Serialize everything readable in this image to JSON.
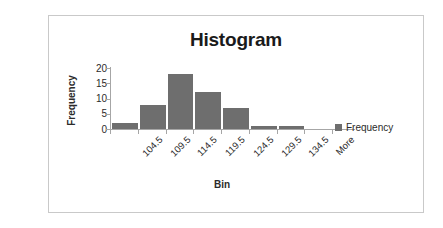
{
  "card": {
    "background": "#ffffff",
    "border_color": "#c9c9c9"
  },
  "chart_data": {
    "type": "bar",
    "title": "Histogram",
    "xlabel": "Bin",
    "ylabel": "Frequency",
    "categories": [
      "104.5",
      "109.5",
      "114.5",
      "119.5",
      "124.5",
      "129.5",
      "134.5",
      "More"
    ],
    "values": [
      2,
      8,
      18,
      12,
      7,
      1,
      1,
      0
    ],
    "series": [
      {
        "name": "Frequency",
        "values": [
          2,
          8,
          18,
          12,
          7,
          1,
          1,
          0
        ],
        "color": "#6e6e6e"
      }
    ],
    "ylim": [
      0,
      20
    ],
    "ytick_values": [
      0,
      5,
      10,
      15,
      20
    ],
    "ytick_labels": [
      "0",
      "5",
      "10",
      "15",
      "20"
    ],
    "grid": false,
    "legend": {
      "position": "right",
      "entries": [
        "Frequency"
      ]
    },
    "xtick_rotation": -45,
    "axis_color": "#a6a6a6"
  }
}
